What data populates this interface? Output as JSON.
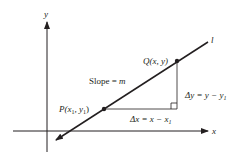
{
  "diagram": {
    "axes": {
      "x_label": "x",
      "y_label": "y"
    },
    "line": {
      "label": "l",
      "slope_label_prefix": "Slope = ",
      "slope_label_var": "m"
    },
    "points": {
      "P": {
        "name": "P",
        "coords": "(x",
        "sub1": "1",
        "mid": ", y",
        "sub2": "1",
        "close": ")"
      },
      "Q": {
        "name": "Q",
        "coords": "(x, y)"
      }
    },
    "deltas": {
      "dy_prefix": "Δy = y − y",
      "dy_sub": "1",
      "dx_prefix": "Δx = x − x",
      "dx_sub": "1"
    },
    "colors": {
      "ink": "#231f20",
      "background": "#ffffff"
    }
  }
}
